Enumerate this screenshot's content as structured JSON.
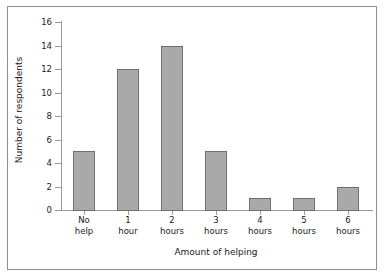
{
  "chart_data": {
    "type": "bar",
    "title": "",
    "subtitle": "",
    "xlabel": "Amount of helping",
    "ylabel": "Number of respondents",
    "categories": [
      "No\nhelp",
      "1\nhour",
      "2\nhours",
      "3\nhours",
      "4\nhours",
      "5\nhours",
      "6\nhours"
    ],
    "values": [
      5,
      12,
      14,
      5,
      1,
      1,
      2
    ],
    "ylim": [
      0,
      16
    ],
    "yticks": [
      0,
      2,
      4,
      6,
      8,
      10,
      12,
      14,
      16
    ],
    "ytick_labels": [
      "0",
      "2",
      "4",
      "6",
      "8",
      "10",
      "12",
      "14",
      "16"
    ],
    "grid": false,
    "legend": null,
    "legend_position": "none",
    "bar_color": "#a9a9a9",
    "bar_edge_color": "#6f6f6f",
    "axis_color": "#9a9a9a",
    "frame_color": "#8e8e8e",
    "background_color": "#ffffff",
    "text_color": "#1a1a1a"
  }
}
